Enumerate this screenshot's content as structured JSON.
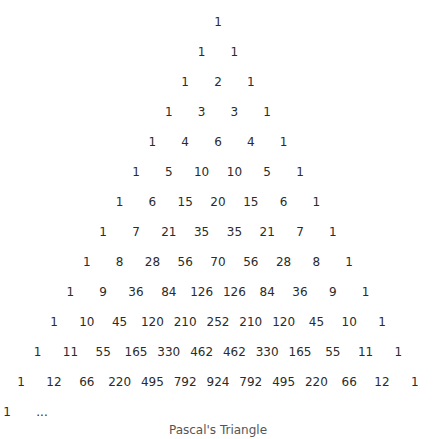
{
  "diagram": {
    "title": "Pascal's Triangle",
    "rows": [
      [
        "1"
      ],
      [
        "1",
        "1"
      ],
      [
        "1",
        "2",
        "1"
      ],
      [
        "1",
        "3",
        "3",
        "1"
      ],
      [
        "1",
        "4",
        "6",
        "4",
        "1"
      ],
      [
        "1",
        "5",
        "10",
        "10",
        "5",
        "1"
      ],
      [
        "1",
        "6",
        "15",
        "20",
        "15",
        "6",
        "1"
      ],
      [
        "1",
        "7",
        "21",
        "35",
        "35",
        "21",
        "7",
        "1"
      ],
      [
        "1",
        "8",
        "28",
        "56",
        "70",
        "56",
        "28",
        "8",
        "1"
      ],
      [
        "1",
        "9",
        "36",
        "84",
        "126",
        "126",
        "84",
        "36",
        "9",
        "1"
      ],
      [
        "1",
        "10",
        "45",
        "120",
        "210",
        "252",
        "210",
        "120",
        "45",
        "10",
        "1"
      ],
      [
        "1",
        "11",
        "55",
        "165",
        "330",
        "462",
        "462",
        "330",
        "165",
        "55",
        "11",
        "1"
      ],
      [
        "1",
        "12",
        "66",
        "220",
        "495",
        "792",
        "924",
        "792",
        "495",
        "220",
        "66",
        "12",
        "1"
      ]
    ],
    "last_row": [
      "1",
      "..."
    ],
    "caption": "Pascal's Triangle"
  }
}
